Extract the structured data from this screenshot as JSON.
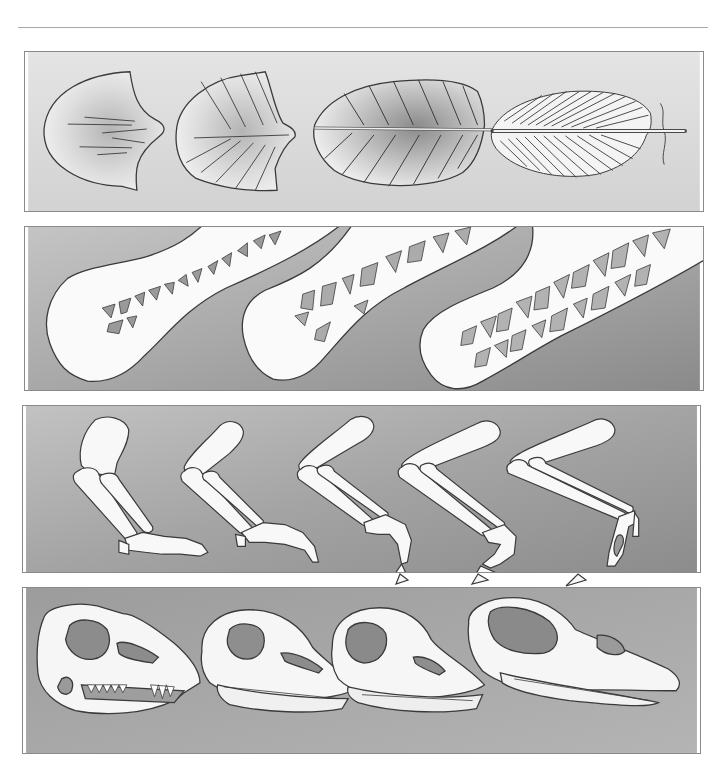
{
  "figure": {
    "rule_color": "#a9a9a9",
    "panel_border_color": "#8a8a8a",
    "outline_color": "#3a3a3a",
    "bone_fill": "#fafafa",
    "panels": [
      {
        "id": "feathers",
        "label": "Feather evolution (scale to vaned feather)",
        "background": [
          "#e2e2e2",
          "#cfcfcf"
        ],
        "items": [
          "scale-like plate",
          "ridged plate with shaft",
          "vaned feather",
          "barbed feather"
        ]
      },
      {
        "id": "bones",
        "label": "Hollow limb bones with internal struts",
        "background": [
          "#bdbdbd",
          "#8e8e8e"
        ],
        "items": [
          "bone section with sparse struts",
          "bone section with chambers",
          "bone section with dense trabecular struts"
        ]
      },
      {
        "id": "limbs",
        "label": "Forelimb skeleton transition to wing",
        "background": [
          "#bcbcbc",
          "#8c8c8c"
        ],
        "items": [
          "reptilian forelimb",
          "theropod forelimb",
          "early bird forelimb",
          "advanced forelimb",
          "modern bird wing"
        ]
      },
      {
        "id": "skulls",
        "label": "Skull transition from toothed jaw to beak",
        "background": [
          "#9a9a9a",
          "#b2b2b2"
        ],
        "items": [
          "dinosaur skull",
          "toothed bird skull",
          "early bird skull",
          "modern bird skull with beak"
        ]
      }
    ]
  }
}
